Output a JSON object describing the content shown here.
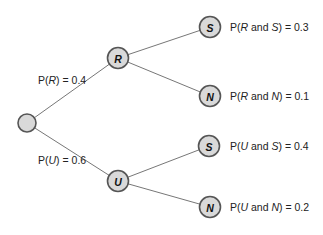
{
  "diagram": {
    "type": "probability-tree",
    "colors": {
      "node_fill": "#d9d9d9",
      "node_stroke": "#555555",
      "edge": "#777777",
      "text": "#222222"
    },
    "root": {
      "label": ""
    },
    "branches": [
      {
        "node": "R",
        "label_prefix": "P(",
        "label_var": "R",
        "label_suffix": ") = 0.4",
        "probability": 0.4,
        "children": [
          {
            "node": "S",
            "label_prefix": "P(",
            "label_a": "R",
            "label_and": " and ",
            "label_b": "S",
            "label_suffix": ") = 0.3",
            "probability": 0.3
          },
          {
            "node": "N",
            "label_prefix": "P(",
            "label_a": "R",
            "label_and": " and ",
            "label_b": "N",
            "label_suffix": ") = 0.1",
            "probability": 0.1
          }
        ]
      },
      {
        "node": "U",
        "label_prefix": "P(",
        "label_var": "U",
        "label_suffix": ") = 0.6",
        "probability": 0.6,
        "children": [
          {
            "node": "S",
            "label_prefix": "P(",
            "label_a": "U",
            "label_and": " and ",
            "label_b": "S",
            "label_suffix": ") = 0.4",
            "probability": 0.4
          },
          {
            "node": "N",
            "label_prefix": "P(",
            "label_a": "U",
            "label_and": " and ",
            "label_b": "N",
            "label_suffix": ") = 0.2",
            "probability": 0.2
          }
        ]
      }
    ]
  }
}
